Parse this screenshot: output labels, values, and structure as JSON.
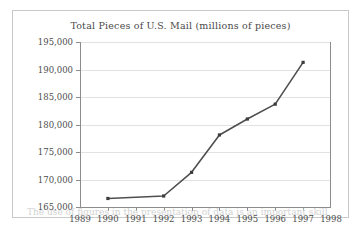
{
  "figure": {
    "caption_partial": "The use of figures in the presentation of data is an important skill"
  },
  "chart_data": {
    "type": "line",
    "title": "Total Pieces of U.S. Mail (millions of pieces)",
    "xlabel": "",
    "ylabel": "",
    "x": [
      1990,
      1992,
      1993,
      1994,
      1995,
      1996,
      1997
    ],
    "values": [
      166550,
      167000,
      171300,
      178100,
      181000,
      183700,
      191300
    ],
    "xlim": [
      1989,
      1998
    ],
    "ylim": [
      165000,
      195000
    ],
    "xticks": [
      1989,
      1990,
      1991,
      1992,
      1993,
      1994,
      1995,
      1996,
      1997,
      1998
    ],
    "xtick_labels": [
      "1989",
      "1990",
      "1991",
      "1992",
      "1993",
      "1994",
      "1995",
      "1996",
      "1997",
      "1998"
    ],
    "yticks": [
      165000,
      170000,
      175000,
      180000,
      185000,
      190000,
      195000
    ],
    "ytick_labels": [
      "165,000",
      "170,000",
      "175,000",
      "180,000",
      "185,000",
      "190,000",
      "195,000"
    ],
    "grid": true,
    "grid_axis": "y",
    "legend": false,
    "marker": "square",
    "line_color": "#4f4f4f",
    "marker_color": "#3c3c3c",
    "grid_color": "#e2e2e2",
    "axis_color": "#8c8c8c",
    "text_color": "#4d4d4d",
    "background": "#ffffff"
  }
}
